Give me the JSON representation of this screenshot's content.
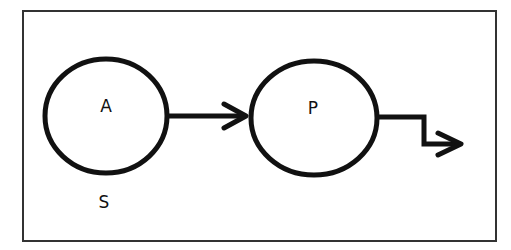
{
  "diagram": {
    "nodes": [
      {
        "id": "A",
        "label": "A",
        "sublabel": "S"
      },
      {
        "id": "P",
        "label": "P"
      }
    ],
    "edges": [
      {
        "from": "A",
        "to": "P",
        "style": "straight-arrow"
      },
      {
        "from": "P",
        "to": "out",
        "style": "zigzag-arrow"
      }
    ]
  }
}
